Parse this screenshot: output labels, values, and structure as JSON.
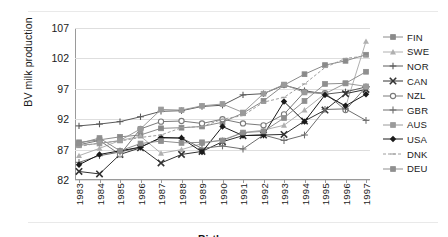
{
  "chart_data": {
    "type": "line",
    "title": "",
    "xlabel": "Birth year",
    "ylabel": "BV milk production",
    "x": [
      1983,
      1984,
      1985,
      1986,
      1987,
      1988,
      1989,
      1990,
      1991,
      1992,
      1993,
      1994,
      1995,
      1996,
      1997
    ],
    "xtick_labels": [
      "1983",
      "1984",
      "1985",
      "1986",
      "1987",
      "1988",
      "1989",
      "1990",
      "1991",
      "1992",
      "1993",
      "1994",
      "1995",
      "1996",
      "1997"
    ],
    "ytick_labels": [
      "82",
      "87",
      "92",
      "97",
      "102",
      "107"
    ],
    "yticks": [
      82,
      87,
      92,
      97,
      102,
      107
    ],
    "ylim": [
      82,
      107
    ],
    "xlim": [
      1983,
      1997
    ],
    "grid": true,
    "legend_position": "right",
    "series": [
      {
        "name": "FIN",
        "color": "#8a8a8a",
        "marker": "square-small",
        "values": [
          88.2,
          88.6,
          89.1,
          89.4,
          90.5,
          90.6,
          90.8,
          91.5,
          93.0,
          95.0,
          97.6,
          99.4,
          100.9,
          101.6,
          102.6
        ]
      },
      {
        "name": "SWE",
        "color": "#b0b0b0",
        "marker": "triangle",
        "values": [
          86.0,
          87.2,
          88.5,
          89.2,
          86.4,
          87.0,
          88.0,
          88.6,
          89.8,
          90.2,
          91.0,
          93.5,
          96.2,
          94.0,
          104.8
        ]
      },
      {
        "name": "NOR",
        "color": "#5a5a5a",
        "marker": "plus-bar",
        "values": [
          90.9,
          91.2,
          91.6,
          92.4,
          93.3,
          93.4,
          94.1,
          94.3,
          96.0,
          96.2,
          97.6,
          96.7,
          96.1,
          96.5,
          97.3
        ]
      },
      {
        "name": "CAN",
        "color": "#333333",
        "marker": "x-bold",
        "values": [
          83.4,
          83.0,
          86.2,
          87.3,
          84.8,
          86.2,
          86.7,
          88.3,
          89.3,
          89.4,
          89.5,
          91.7,
          93.5,
          96.2,
          96.9
        ]
      },
      {
        "name": "NZL",
        "color": "#7a7a7a",
        "marker": "circle",
        "values": [
          87.8,
          88.5,
          86.2,
          90.4,
          91.6,
          91.7,
          91.3,
          92.0,
          91.3,
          91.0,
          92.8,
          96.5,
          96.3,
          93.5,
          97.3
        ]
      },
      {
        "name": "GBR",
        "color": "#6e6e6e",
        "marker": "plus",
        "values": [
          84.9,
          86.0,
          86.6,
          87.4,
          88.9,
          88.9,
          87.2,
          87.6,
          87.1,
          89.4,
          88.5,
          89.4,
          93.6,
          93.7,
          91.8
        ]
      },
      {
        "name": "AUS",
        "color": "#9a9a9a",
        "marker": "square",
        "values": [
          87.7,
          88.0,
          88.5,
          90.4,
          93.6,
          93.5,
          94.2,
          94.5,
          93.1,
          96.2,
          97.7,
          96.4,
          96.2,
          97.9,
          97.4
        ]
      },
      {
        "name": "USA",
        "color": "#1a1a1a",
        "marker": "diamond-filled",
        "values": [
          84.5,
          86.2,
          86.8,
          87.4,
          89.0,
          88.9,
          86.6,
          90.8,
          89.3,
          89.4,
          94.9,
          91.6,
          96.0,
          94.2,
          96.1
        ]
      },
      {
        "name": "DNK",
        "color": "#9e9e9e",
        "marker": "line",
        "values": [
          87.5,
          88.1,
          88.4,
          89.0,
          89.4,
          90.6,
          90.8,
          92.0,
          92.6,
          94.8,
          95.6,
          97.8,
          100.5,
          102.0,
          102.4
        ]
      },
      {
        "name": "DEU",
        "color": "#8f8f8f",
        "marker": "square-grey",
        "values": [
          88.0,
          88.9,
          86.8,
          88.0,
          88.4,
          88.1,
          88.2,
          88.5,
          89.8,
          90.0,
          92.2,
          95.0,
          97.8,
          97.9,
          99.8
        ]
      }
    ]
  },
  "legend": {
    "items": [
      "FIN",
      "SWE",
      "NOR",
      "CAN",
      "NZL",
      "GBR",
      "AUS",
      "USA",
      "DNK",
      "DEU"
    ]
  }
}
